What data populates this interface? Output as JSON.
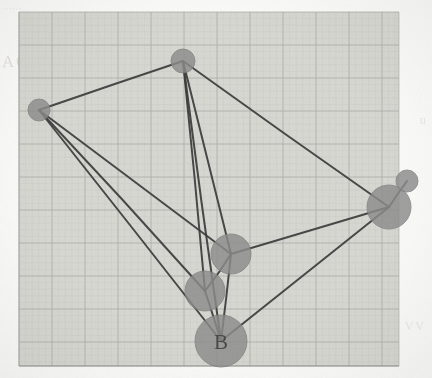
{
  "paper": {
    "sheet_color": "#d9d9d4",
    "page_background": "#fdfdfc",
    "grid": {
      "minor_color": "#c2c3c0",
      "major_color": "#a9aaa6",
      "minor_spacing": 6.6,
      "major_every": 5,
      "left": 19,
      "top": 12,
      "right": 399,
      "bottom": 366
    },
    "bleed_text": {
      "left": "AGA",
      "top": "......",
      "right": "u",
      "bottom_right": "VV"
    }
  },
  "diagram": {
    "type": "graph",
    "ink_color": "#3c3c3c",
    "node_fill": "#8e8e8e",
    "node_stroke": "#7e7e7e",
    "label_color": "#4a4a4a",
    "edge_width": 2.0,
    "nodes": [
      {
        "id": "n1",
        "label": "",
        "x": 183,
        "y": 61,
        "r": 12
      },
      {
        "id": "n2",
        "label": "",
        "x": 39,
        "y": 110,
        "r": 11
      },
      {
        "id": "n3",
        "label": "",
        "x": 389,
        "y": 207,
        "r": 22
      },
      {
        "id": "n4",
        "label": "",
        "x": 407,
        "y": 181,
        "r": 11
      },
      {
        "id": "n5",
        "label": "",
        "x": 231,
        "y": 254,
        "r": 20
      },
      {
        "id": "n6",
        "label": "",
        "x": 205,
        "y": 291,
        "r": 20
      },
      {
        "id": "n7",
        "label": "B",
        "x": 221,
        "y": 341,
        "r": 26
      }
    ],
    "edges": [
      {
        "from": "n2",
        "to": "n1"
      },
      {
        "from": "n1",
        "to": "n3"
      },
      {
        "from": "n1",
        "to": "n5"
      },
      {
        "from": "n1",
        "to": "n6"
      },
      {
        "from": "n1",
        "to": "n7"
      },
      {
        "from": "n2",
        "to": "n5"
      },
      {
        "from": "n2",
        "to": "n6"
      },
      {
        "from": "n2",
        "to": "n7"
      },
      {
        "from": "n5",
        "to": "n3"
      },
      {
        "from": "n5",
        "to": "n6"
      },
      {
        "from": "n5",
        "to": "n7"
      },
      {
        "from": "n6",
        "to": "n7"
      },
      {
        "from": "n7",
        "to": "n3"
      },
      {
        "from": "n3",
        "to": "n4"
      }
    ],
    "node_count": 7,
    "edge_count": 14,
    "labels": [
      "B"
    ]
  }
}
